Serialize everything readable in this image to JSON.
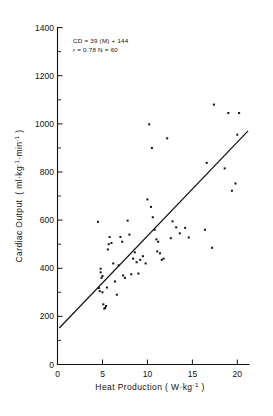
{
  "figure": {
    "background_color": "#ffffff",
    "ink_color": "#111111"
  },
  "chart_data": {
    "type": "scatter",
    "title": "",
    "subtitle": "",
    "xlabel": "Heat Production  ( W·kg",
    "xlabel_exponent": "-1",
    "xlabel_tail": " )",
    "xlabel_full": "Heat Production  ( W kg-1 )",
    "ylabel_part1": "Cardiac  Output",
    "ylabel_part2": "( ml·kg",
    "ylabel_exp1": "-1",
    "ylabel_part3": "·min",
    "ylabel_exp2": "-1",
    "ylabel_part4": " )",
    "ylabel_full": "Cardiac Output ( ml kg-1 min-1 )",
    "xlim": [
      0,
      21.5
    ],
    "ylim": [
      0,
      1400
    ],
    "grid": false,
    "legend": "none",
    "xticks": [
      0,
      5,
      10,
      15,
      20
    ],
    "xtick_labels": [
      "0",
      "5",
      "10",
      "15",
      "20"
    ],
    "yticks": [
      0,
      200,
      400,
      600,
      800,
      1000,
      1200,
      1400
    ],
    "ytick_labels": [
      "0",
      "200",
      "400",
      "600",
      "800",
      "1000",
      "1200",
      "1400"
    ],
    "y_minor_ticks": [
      100,
      300,
      500,
      700,
      900,
      1100,
      1300
    ],
    "annotations": [
      "CD = 39 (M) + 144",
      "r = 0.78   N = 60"
    ],
    "regression": {
      "slope": 39,
      "intercept": 144,
      "r": 0.78,
      "n": 60,
      "x_start": 0.2,
      "x_end": 21.2,
      "equation_text": "CD = 39 (M) + 144",
      "stats_text": "r = 0.78   N = 60"
    },
    "x": [
      4.5,
      4.6,
      4.7,
      4.8,
      4.8,
      4.9,
      5.0,
      5.0,
      5.1,
      5.2,
      5.3,
      5.4,
      5.5,
      5.6,
      5.7,
      5.8,
      6.0,
      6.2,
      6.4,
      6.6,
      6.8,
      7.0,
      7.2,
      7.3,
      7.5,
      7.8,
      8.0,
      8.2,
      8.4,
      8.6,
      8.8,
      9.0,
      9.2,
      9.5,
      9.8,
      10.0,
      10.2,
      10.4,
      10.5,
      10.6,
      10.8,
      11.0,
      11.1,
      11.2,
      11.4,
      11.6,
      11.8,
      12.2,
      12.6,
      12.8,
      13.2,
      13.6,
      14.2,
      14.6,
      16.4,
      16.6,
      17.2,
      17.4,
      18.6,
      19.0,
      19.4,
      19.8,
      20.0,
      20.2
    ],
    "y": [
      593,
      318,
      305,
      398,
      383,
      360,
      368,
      300,
      250,
      232,
      235,
      243,
      320,
      478,
      500,
      530,
      505,
      420,
      345,
      290,
      412,
      530,
      510,
      370,
      360,
      598,
      540,
      375,
      440,
      466,
      425,
      378,
      435,
      450,
      420,
      686,
      998,
      655,
      900,
      612,
      560,
      520,
      470,
      510,
      462,
      435,
      440,
      940,
      525,
      595,
      570,
      545,
      568,
      528,
      560,
      838,
      485,
      1080,
      815,
      1045,
      722,
      752,
      955,
      1045
    ],
    "point_count": 60,
    "marker": "square",
    "marker_size": 2
  }
}
